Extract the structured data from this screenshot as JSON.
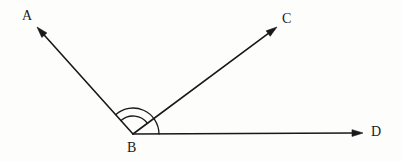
{
  "figure": {
    "kind": "angle-diagram",
    "background_color": "#fdfdfc",
    "stroke_color": "#19191c",
    "stroke_width": 1.6,
    "arc_stroke_width": 1.3,
    "labels": {
      "a": "A",
      "b": "B",
      "c": "C",
      "d": "D"
    },
    "points": {
      "vertex_b": {
        "x": 133,
        "y": 134
      },
      "tip_a": {
        "x": 37,
        "y": 27
      },
      "tip_c": {
        "x": 277,
        "y": 27
      },
      "tip_d": {
        "x": 363,
        "y": 133
      }
    },
    "rays": [
      {
        "name": "ray-ba",
        "from": "B",
        "to": "A",
        "x1": 133,
        "y1": 134,
        "x2": 37,
        "y2": 27,
        "arrowhead_at": "A"
      },
      {
        "name": "ray-bc",
        "from": "B",
        "to": "C",
        "x1": 133,
        "y1": 134,
        "x2": 277,
        "y2": 27,
        "arrowhead_at": "C"
      },
      {
        "name": "ray-bd",
        "from": "B",
        "to": "D",
        "x1": 133,
        "y1": 134,
        "x2": 363,
        "y2": 133,
        "arrowhead_at": "D"
      }
    ],
    "arcs": [
      {
        "name": "angle-arc-abc",
        "radius": 18,
        "from_ray": "BA",
        "to_ray": "BC"
      },
      {
        "name": "angle-arc-abd",
        "radius": 26,
        "from_ray": "BA",
        "to_ray": "BD"
      }
    ],
    "arrow": {
      "length": 11,
      "half_width": 3.4
    }
  }
}
